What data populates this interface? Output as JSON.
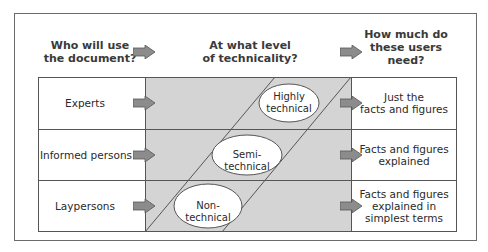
{
  "headers": {
    "col1": "Who will use the document?",
    "col1_line1": "Who will use",
    "col1_line2": "the document?",
    "col2_line1": "At what level",
    "col2_line2": "of technicality?",
    "col3_line1": "How much do",
    "col3_line2": "these users",
    "col3_line3": "need?"
  },
  "rows": [
    {
      "audience": "Experts",
      "technicality_line1": "Highly",
      "technicality_line2": "technical",
      "need_line1": "Just the",
      "need_line2": "facts and figures",
      "need_line3": ""
    },
    {
      "audience": "Informed persons",
      "technicality_line1": "Semi-technical",
      "technicality_line2": "",
      "need_line1": "Facts and figures",
      "need_line2": "explained",
      "need_line3": ""
    },
    {
      "audience": "Laypersons",
      "technicality_line1": "Non-technical",
      "technicality_line2": "",
      "need_line1": "Facts and figures",
      "need_line2": "explained in",
      "need_line3": "simplest terms"
    }
  ],
  "colors": {
    "shaded_band": "#d4d4d4",
    "arrow_fill": "#8c8c8c",
    "lines": "#555555",
    "header_text": "#3a3a3a"
  }
}
